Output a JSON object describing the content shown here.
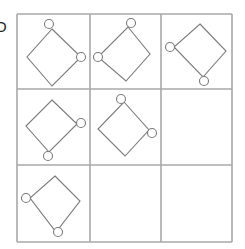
{
  "puzzle": {
    "label": "D",
    "rows": 3,
    "cols": 3,
    "grid_color": "#a8a8a8",
    "shape_color": "#7a7a7a",
    "grid": {
      "x": [
        17,
        90,
        161,
        232
      ],
      "y": [
        14,
        89,
        165,
        242
      ]
    },
    "cells": [
      {
        "row": 1,
        "col": 1,
        "shape": "diamond",
        "points": [
          [
            52,
            29
          ],
          [
            81,
            57
          ],
          [
            52,
            86
          ],
          [
            27,
            57
          ]
        ],
        "circles": [
          {
            "cx": 49,
            "cy": 24,
            "r": 4.5
          },
          {
            "cx": 81,
            "cy": 57,
            "r": 4.5
          }
        ]
      },
      {
        "row": 1,
        "col": 2,
        "shape": "diamond",
        "points": [
          [
            128,
            27
          ],
          [
            150,
            54
          ],
          [
            126,
            81
          ],
          [
            98,
            57
          ]
        ],
        "circles": [
          {
            "cx": 131,
            "cy": 23,
            "r": 4.5
          },
          {
            "cx": 98,
            "cy": 57,
            "r": 4.5
          }
        ]
      },
      {
        "row": 1,
        "col": 3,
        "shape": "diamond",
        "points": [
          [
            200,
            24
          ],
          [
            226,
            51
          ],
          [
            203,
            77
          ],
          [
            174,
            47
          ]
        ],
        "circles": [
          {
            "cx": 170,
            "cy": 47,
            "r": 4.5
          },
          {
            "cx": 204,
            "cy": 81,
            "r": 4.5
          }
        ]
      },
      {
        "row": 2,
        "col": 1,
        "shape": "diamond",
        "points": [
          [
            52,
            100
          ],
          [
            77,
            124
          ],
          [
            49,
            152
          ],
          [
            26,
            126
          ]
        ],
        "circles": [
          {
            "cx": 81,
            "cy": 123,
            "r": 4.5
          },
          {
            "cx": 48,
            "cy": 156,
            "r": 4.5
          }
        ]
      },
      {
        "row": 2,
        "col": 2,
        "shape": "diamond",
        "points": [
          [
            124,
            102
          ],
          [
            149,
            130
          ],
          [
            125,
            156
          ],
          [
            98,
            129
          ]
        ],
        "circles": [
          {
            "cx": 121,
            "cy": 99,
            "r": 4.5
          },
          {
            "cx": 152,
            "cy": 133,
            "r": 4.5
          }
        ]
      },
      {
        "row": 3,
        "col": 1,
        "shape": "diamond",
        "points": [
          [
            55,
            176
          ],
          [
            80,
            201
          ],
          [
            56,
            232
          ],
          [
            30,
            198
          ]
        ],
        "circles": [
          {
            "cx": 26,
            "cy": 198,
            "r": 4.5
          },
          {
            "cx": 58,
            "cy": 232,
            "r": 4.5
          }
        ]
      },
      {
        "row": 3,
        "col": 2,
        "shape": "empty"
      },
      {
        "row": 3,
        "col": 3,
        "shape": "empty"
      },
      {
        "row": 2,
        "col": 3,
        "shape": "empty"
      }
    ]
  }
}
